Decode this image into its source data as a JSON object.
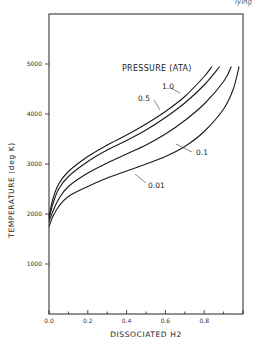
{
  "chart_data": {
    "type": "line",
    "title": "",
    "xlabel": "DISSOCIATED H2",
    "ylabel": "TEMPERATURE (deg K)",
    "xlim": [
      0,
      1.0
    ],
    "ylim": [
      0,
      6000
    ],
    "x_ticks": [
      "0.0",
      "0.2",
      "0.4",
      "0.6",
      "0.8"
    ],
    "y_ticks": [
      "1000",
      "2000",
      "3000",
      "4000",
      "5000"
    ],
    "grid": false,
    "legend_title": "PRESSURE (ATA)",
    "legend_position": "upper-center, curves labeled inline",
    "series": [
      {
        "name": "1.0",
        "points": [
          [
            0.0,
            1950
          ],
          [
            0.02,
            2300
          ],
          [
            0.05,
            2600
          ],
          [
            0.1,
            2850
          ],
          [
            0.2,
            3150
          ],
          [
            0.3,
            3380
          ],
          [
            0.4,
            3580
          ],
          [
            0.5,
            3800
          ],
          [
            0.6,
            4050
          ],
          [
            0.7,
            4350
          ],
          [
            0.8,
            4750
          ],
          [
            0.84,
            4950
          ]
        ]
      },
      {
        "name": "0.5",
        "points": [
          [
            0.0,
            1900
          ],
          [
            0.02,
            2200
          ],
          [
            0.05,
            2500
          ],
          [
            0.1,
            2750
          ],
          [
            0.2,
            3050
          ],
          [
            0.3,
            3280
          ],
          [
            0.4,
            3470
          ],
          [
            0.5,
            3680
          ],
          [
            0.6,
            3930
          ],
          [
            0.7,
            4220
          ],
          [
            0.8,
            4580
          ],
          [
            0.88,
            4950
          ]
        ]
      },
      {
        "name": "0.1",
        "points": [
          [
            0.0,
            1850
          ],
          [
            0.02,
            2050
          ],
          [
            0.05,
            2300
          ],
          [
            0.1,
            2550
          ],
          [
            0.2,
            2820
          ],
          [
            0.3,
            3020
          ],
          [
            0.4,
            3200
          ],
          [
            0.5,
            3380
          ],
          [
            0.6,
            3600
          ],
          [
            0.7,
            3870
          ],
          [
            0.8,
            4200
          ],
          [
            0.9,
            4650
          ],
          [
            0.94,
            4950
          ]
        ]
      },
      {
        "name": "0.01",
        "points": [
          [
            0.0,
            1750
          ],
          [
            0.02,
            1950
          ],
          [
            0.05,
            2150
          ],
          [
            0.1,
            2350
          ],
          [
            0.2,
            2550
          ],
          [
            0.3,
            2720
          ],
          [
            0.4,
            2860
          ],
          [
            0.5,
            3000
          ],
          [
            0.6,
            3150
          ],
          [
            0.7,
            3350
          ],
          [
            0.8,
            3650
          ],
          [
            0.9,
            4100
          ],
          [
            0.95,
            4500
          ],
          [
            0.98,
            4950
          ]
        ]
      }
    ],
    "annotations": [
      {
        "text": "1.0",
        "x": 0.7,
        "y": 4700
      },
      {
        "text": "0.5",
        "x": 0.52,
        "y": 4050
      },
      {
        "text": "0.1",
        "x": 0.78,
        "y": 3150
      },
      {
        "text": "0.01",
        "x": 0.58,
        "y": 2700
      }
    ]
  },
  "header": {
    "page_fragment": "lying"
  }
}
